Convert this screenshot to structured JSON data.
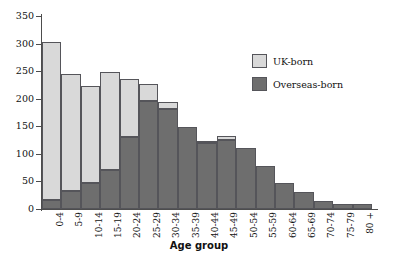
{
  "chart_data": {
    "type": "bar",
    "stacked": true,
    "title": "",
    "subtitle": "",
    "xlabel": "Age group",
    "ylabel": "",
    "ylim": [
      0,
      350
    ],
    "yticks": [
      0,
      50,
      100,
      150,
      200,
      250,
      300,
      350
    ],
    "grid": false,
    "legend_position": "upper right",
    "categories": [
      "0-4",
      "5-9",
      "10-14",
      "15-19",
      "20-24",
      "25-29",
      "30-34",
      "35-39",
      "40-44",
      "45-49",
      "50-54",
      "55-59",
      "60-64",
      "65-69",
      "70-74",
      "75-79",
      "80 +"
    ],
    "series": [
      {
        "name": "Overseas-born",
        "color": "#6e6e6e",
        "values": [
          16,
          32,
          48,
          70,
          130,
          195,
          182,
          148,
          120,
          126,
          110,
          78,
          47,
          30,
          15,
          9,
          10
        ]
      },
      {
        "name": "UK-born",
        "color": "#d9d9d9",
        "values": [
          287,
          212,
          175,
          178,
          105,
          31,
          12,
          0,
          2,
          7,
          0,
          0,
          0,
          0,
          0,
          0,
          0
        ]
      }
    ],
    "totals": [
      303,
      244,
      223,
      248,
      235,
      226,
      194,
      148,
      122,
      133,
      110,
      78,
      47,
      30,
      15,
      9,
      10
    ]
  },
  "legend": {
    "items": [
      {
        "label": "UK-born",
        "color": "#d9d9d9"
      },
      {
        "label": "Overseas-born",
        "color": "#6e6e6e"
      }
    ]
  },
  "axis": {
    "x_title": "Age group"
  },
  "caption": {
    "partial_text": ""
  }
}
